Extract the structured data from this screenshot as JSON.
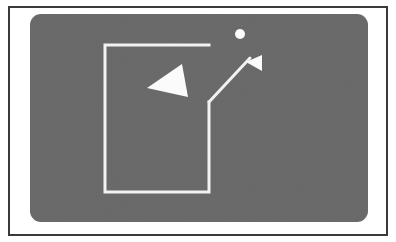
{
  "figure": {
    "caption": "",
    "canvas": {
      "width": 396,
      "height": 242
    },
    "colors": {
      "page_background": "#ffffff",
      "frame_border": "#3a3a3a",
      "inner_margin": "#ffffff",
      "panel_fill": "#6b6b6b",
      "line_stroke": "#f2f2f2",
      "shape_fill": "#fbfbfb"
    },
    "frame": {
      "x": 8,
      "y": 6,
      "width": 380,
      "height": 230,
      "border_width": 2
    },
    "panel": {
      "x": 30,
      "y": 14,
      "width": 338,
      "height": 208,
      "corner_radius": 11
    },
    "shapes": {
      "open_rectangle": {
        "label": "open-rectangle",
        "stroke_width": 3,
        "points": "209,45 105,45 105,192 209,192 209,102"
      },
      "leader_line": {
        "label": "leader-line",
        "stroke_width": 3,
        "x1": 209,
        "y1": 102,
        "x2": 250,
        "y2": 58
      },
      "large_triangle": {
        "label": "large-left-arrow",
        "points": "147,88 182,64 188,97"
      },
      "small_triangle": {
        "label": "small-left-arrow",
        "points": "246,62 262,55 262,71"
      },
      "dot": {
        "label": "dot-marker",
        "cx": 240,
        "cy": 34,
        "r": 5
      }
    }
  }
}
